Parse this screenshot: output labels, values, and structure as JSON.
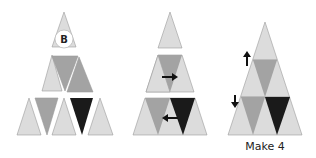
{
  "panels": [
    {
      "id": "panel-1",
      "description": "Triangle grid of separated pieces with badge on top piece",
      "badge": {
        "label": "B"
      }
    },
    {
      "id": "panel-2",
      "description": "Rows assembled with arrows indicating swaps",
      "arrows": [
        "right",
        "left"
      ]
    },
    {
      "id": "panel-3",
      "description": "Assembled triangle with up and down arrows",
      "arrows": [
        "up",
        "down"
      ],
      "caption": "Make 4"
    }
  ],
  "colors": {
    "light": "#dcdcdc",
    "mid": "#a3a3a3",
    "dark": "#1a1a1a",
    "background": "#ffffff"
  }
}
